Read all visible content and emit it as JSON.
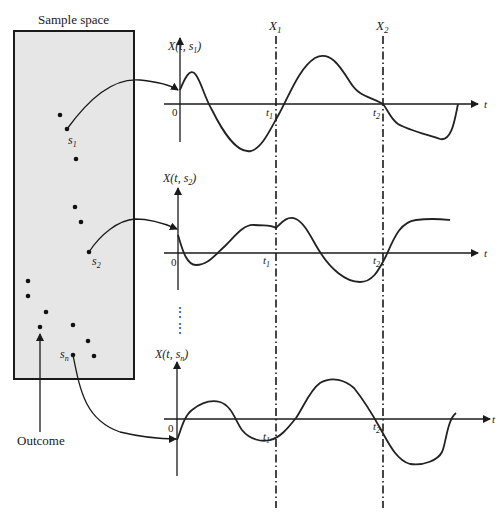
{
  "sample_space": {
    "title": "Sample space",
    "fill": "#e6e6e6",
    "labels": {
      "s1": "s",
      "s1_sub": "1",
      "s2": "s",
      "s2_sub": "2",
      "sn": "s",
      "sn_sub": "n"
    },
    "outcome_label": "Outcome"
  },
  "plots": [
    {
      "ylabel_pre": "X(t, s",
      "ylabel_sub": "1",
      "ylabel_post": ")",
      "origin": "0",
      "t1": "t",
      "t1_sub": "1",
      "t2": "t",
      "t2_sub": "2",
      "xlabel": "t"
    },
    {
      "ylabel_pre": "X(t, s",
      "ylabel_sub": "2",
      "ylabel_post": ")",
      "origin": "0",
      "t1": "t",
      "t1_sub": "1",
      "t2": "t",
      "t2_sub": "2",
      "xlabel": "t"
    },
    {
      "ylabel_pre": "X(t, s",
      "ylabel_sub": "n",
      "ylabel_post": ")",
      "origin": "0",
      "t1": "t",
      "t1_sub": "1",
      "t2": "t",
      "t2_sub": "2",
      "xlabel": "t"
    }
  ],
  "random_variables": {
    "x1": "X",
    "x1_sub": "1",
    "x2": "X",
    "x2_sub": "2"
  },
  "ellipsis": "⋮"
}
